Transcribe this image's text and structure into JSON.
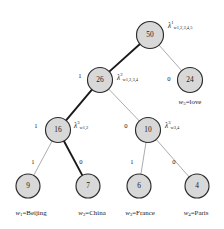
{
  "diagram": {
    "type": "huffman-binary-tree",
    "title": "",
    "nodes": [
      {
        "id": "n50",
        "value": "50",
        "cx": 150,
        "cy": 35,
        "r": 13.5,
        "level": 0
      },
      {
        "id": "n26",
        "value": "26",
        "cx": 100,
        "cy": 80,
        "r": 12.5,
        "level": 1
      },
      {
        "id": "n24",
        "value": "24",
        "cx": 190,
        "cy": 80,
        "r": 12.5,
        "level": 1
      },
      {
        "id": "n16",
        "value": "16",
        "cx": 58,
        "cy": 130,
        "r": 12.5,
        "level": 2
      },
      {
        "id": "n10",
        "value": "10",
        "cx": 148,
        "cy": 130,
        "r": 12.5,
        "level": 2
      },
      {
        "id": "n9",
        "value": "9",
        "cx": 28,
        "cy": 186,
        "r": 12.0,
        "level": 3
      },
      {
        "id": "n7",
        "value": "7",
        "cx": 88,
        "cy": 186,
        "r": 12.0,
        "level": 3
      },
      {
        "id": "n6",
        "value": "6",
        "cx": 139,
        "cy": 186,
        "r": 12.0,
        "level": 3
      },
      {
        "id": "n4",
        "value": "4",
        "cx": 197,
        "cy": 186,
        "r": 12.0,
        "level": 3
      }
    ],
    "edges": [
      {
        "id": "e50-26",
        "from": "n50",
        "to": "n26",
        "label": "1",
        "style": "bold",
        "label_x": 80,
        "label_y": 76
      },
      {
        "id": "e50-24",
        "from": "n50",
        "to": "n24",
        "label": "0",
        "style": "light",
        "label_x": 169,
        "label_y": 79
      },
      {
        "id": "e26-16",
        "from": "n26",
        "to": "n16",
        "label": "1",
        "style": "bold",
        "label_x": 36,
        "label_y": 126
      },
      {
        "id": "e26-10",
        "from": "n26",
        "to": "n10",
        "label": "0",
        "style": "light",
        "label_x": 126,
        "label_y": 126
      },
      {
        "id": "e16-9",
        "from": "n16",
        "to": "n9",
        "label": "1",
        "style": "light",
        "label_x": 33,
        "label_y": 162
      },
      {
        "id": "e16-7",
        "from": "n16",
        "to": "n7",
        "label": "0",
        "style": "bold",
        "label_x": 81,
        "label_y": 162
      },
      {
        "id": "e10-6",
        "from": "n10",
        "to": "n6",
        "label": "1",
        "style": "light",
        "label_x": 132,
        "label_y": 162
      },
      {
        "id": "e10-4",
        "from": "n10",
        "to": "n4",
        "label": "0",
        "style": "light",
        "label_x": 174,
        "label_y": 162
      }
    ],
    "lambda_labels": [
      {
        "id": "lam1",
        "symbol": "λ",
        "superscript": "1",
        "subscript": "w1,2,3,4,5",
        "x": 168,
        "y": 26,
        "node": "n50"
      },
      {
        "id": "lam2",
        "symbol": "λ",
        "superscript": "2",
        "subscript": "w1,2,3,4",
        "x": 117,
        "y": 78,
        "node": "n26"
      },
      {
        "id": "lam3",
        "symbol": "λ",
        "superscript": "3",
        "subscript": "w1,2",
        "x": 74,
        "y": 126,
        "node": "n16"
      },
      {
        "id": "lam4",
        "symbol": "λ",
        "superscript": "3",
        "subscript": "w3,4",
        "x": 165,
        "y": 126,
        "node": "n10"
      }
    ],
    "leaf_labels": [
      {
        "id": "leaf1",
        "word": "w",
        "index": "1",
        "equals": "=",
        "text": "Beijing",
        "x": 31,
        "y": 213,
        "node": "n9"
      },
      {
        "id": "leaf2",
        "word": "w",
        "index": "2",
        "equals": "=",
        "text": "China",
        "x": 92,
        "y": 213,
        "node": "n7"
      },
      {
        "id": "leaf3",
        "word": "w",
        "index": "3",
        "equals": "=",
        "text": "France",
        "x": 140,
        "y": 213,
        "node": "n6"
      },
      {
        "id": "leaf4",
        "word": "w",
        "index": "4",
        "equals": "=",
        "text": "Paris",
        "x": 196,
        "y": 213,
        "node": "n4"
      },
      {
        "id": "leaf5",
        "word": "w",
        "index": "5",
        "equals": "=",
        "text": "love",
        "x": 190,
        "y": 102,
        "node": "n24"
      }
    ],
    "colors": {
      "node_fill": "#d8d8d8",
      "node_stroke": "#2b2b2b",
      "edge_bold": "#1a1a1a",
      "edge_light": "#a8a8a8",
      "text": "#1a1a1a",
      "background": "#ffffff"
    }
  }
}
